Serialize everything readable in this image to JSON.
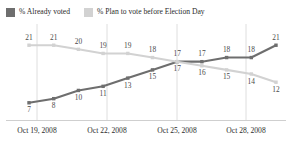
{
  "legend": {
    "entries": [
      {
        "label": "% Already voted",
        "color": "#6e6e6e",
        "swatch": "legend-swatch-already-voted"
      },
      {
        "label": "% Plan to vote before Election Day",
        "color": "#d2d2d2",
        "swatch": "legend-swatch-plan-to-vote"
      }
    ]
  },
  "axis": {
    "ticks": [
      {
        "label": "Oct 19, 2008",
        "x": 37
      },
      {
        "label": "Oct 22, 2008",
        "x": 107
      },
      {
        "label": "Oct 25, 2008",
        "x": 177
      },
      {
        "label": "Oct 28, 2008",
        "x": 246
      }
    ],
    "baseline_color": "#cfcfcf",
    "gridline_color": "#dedede"
  },
  "chart_data": {
    "type": "line",
    "title": "",
    "subtitle": "",
    "xlabel": "",
    "ylabel": "",
    "grid": true,
    "legend_position": "top-left",
    "x": [
      "Oct 19, 2008",
      "Oct 20, 2008",
      "Oct 21, 2008",
      "Oct 22, 2008",
      "Oct 23, 2008",
      "Oct 24, 2008",
      "Oct 25, 2008",
      "Oct 26, 2008",
      "Oct 27, 2008",
      "Oct 28, 2008",
      "Oct 29, 2008"
    ],
    "xtick_labels": [
      "Oct 19, 2008",
      "Oct 22, 2008",
      "Oct 25, 2008",
      "Oct 28, 2008"
    ],
    "ylim": [
      5,
      23
    ],
    "series": [
      {
        "name": "% Already voted",
        "color": "#6e6e6e",
        "values": [
          7,
          8,
          10,
          11,
          13,
          15,
          17,
          17,
          18,
          18,
          21
        ],
        "label_positions": [
          "below",
          "below",
          "below",
          "below",
          "below",
          "below",
          "below",
          "above",
          "above",
          "above",
          "above"
        ]
      },
      {
        "name": "% Plan to vote before Election Day",
        "color": "#d2d2d2",
        "values": [
          21,
          21,
          20,
          19,
          19,
          18,
          17,
          16,
          15,
          14,
          12
        ],
        "label_positions": [
          "above",
          "above",
          "above",
          "above",
          "above",
          "above",
          "above",
          "below",
          "below",
          "below",
          "below"
        ]
      }
    ]
  }
}
